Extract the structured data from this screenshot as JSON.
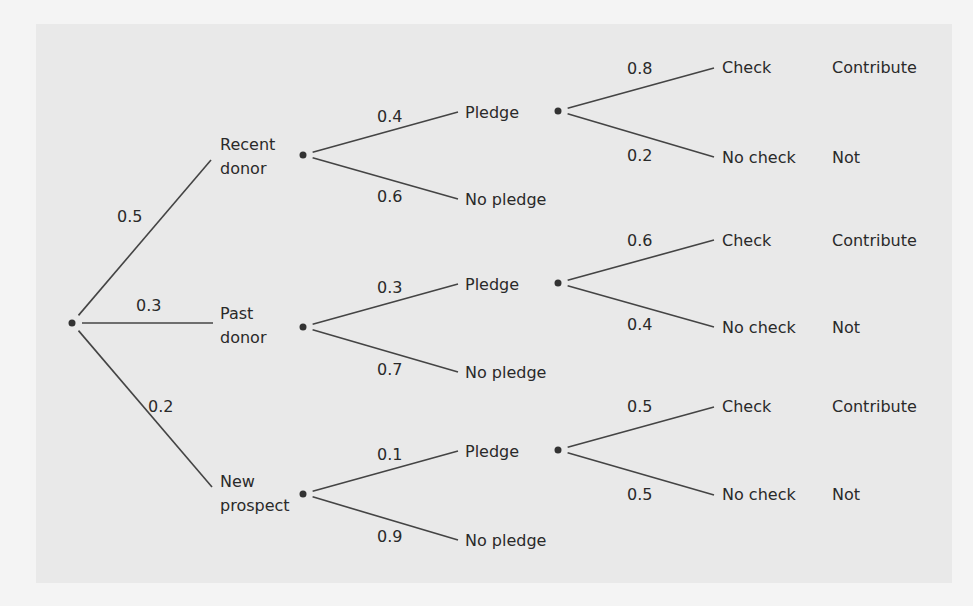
{
  "diagram": {
    "type": "probability tree",
    "root": {
      "x": 72,
      "y": 323
    },
    "level1": [
      {
        "label_lines": [
          "Recent",
          "donor"
        ],
        "prob": "0.5",
        "line_end": [
          211,
          160
        ],
        "prob_pos": [
          117,
          222
        ],
        "label_pos": [
          220,
          150
        ],
        "dot": [
          303,
          155
        ],
        "children": [
          {
            "label": "Pledge",
            "prob": "0.4",
            "line_end": [
              458,
              112
            ],
            "prob_pos": [
              377,
              122
            ],
            "label_pos": [
              465,
              118
            ]
          },
          {
            "label": "No pledge",
            "prob": "0.6",
            "line_end": [
              458,
              199
            ],
            "prob_pos": [
              377,
              202
            ],
            "label_pos": [
              465,
              205
            ]
          }
        ]
      },
      {
        "label_lines": [
          "Past",
          "donor"
        ],
        "prob": "0.3",
        "line_end": [
          213,
          323
        ],
        "prob_pos": [
          136,
          311
        ],
        "label_pos": [
          220,
          319
        ],
        "dot": [
          303,
          327
        ],
        "children": [
          {
            "label": "Pledge",
            "prob": "0.3",
            "line_end": [
              458,
              284
            ],
            "prob_pos": [
              377,
              293
            ],
            "label_pos": [
              465,
              290
            ]
          },
          {
            "label": "No pledge",
            "prob": "0.7",
            "line_end": [
              458,
              372
            ],
            "prob_pos": [
              377,
              375
            ],
            "label_pos": [
              465,
              378
            ]
          }
        ]
      },
      {
        "label_lines": [
          "New",
          "prospect"
        ],
        "prob": "0.2",
        "line_end": [
          212,
          487
        ],
        "prob_pos": [
          148,
          412
        ],
        "label_pos": [
          220,
          487
        ],
        "dot": [
          303,
          494
        ],
        "children": [
          {
            "label": "Pledge",
            "prob": "0.1",
            "line_end": [
              458,
              451
            ],
            "prob_pos": [
              377,
              460
            ],
            "label_pos": [
              465,
              457
            ]
          },
          {
            "label": "No pledge",
            "prob": "0.9",
            "line_end": [
              458,
              540
            ],
            "prob_pos": [
              377,
              542
            ],
            "label_pos": [
              465,
              546
            ]
          }
        ]
      }
    ],
    "level2": [
      {
        "dot": [
          558,
          111
        ],
        "outcomes": [
          {
            "label": "Check",
            "prob": "0.8",
            "result": "Contribute",
            "line_end": [
              714,
              68
            ],
            "prob_pos": [
              627,
              74
            ],
            "label_pos": [
              722,
              73
            ]
          },
          {
            "label": "No check",
            "prob": "0.2",
            "result": "Not",
            "line_end": [
              714,
              157
            ],
            "prob_pos": [
              627,
              161
            ],
            "label_pos": [
              722,
              163
            ]
          }
        ]
      },
      {
        "dot": [
          558,
          283
        ],
        "outcomes": [
          {
            "label": "Check",
            "prob": "0.6",
            "result": "Contribute",
            "line_end": [
              714,
              240
            ],
            "prob_pos": [
              627,
              246
            ],
            "label_pos": [
              722,
              246
            ]
          },
          {
            "label": "No check",
            "prob": "0.4",
            "result": "Not",
            "line_end": [
              714,
              327
            ],
            "prob_pos": [
              627,
              330
            ],
            "label_pos": [
              722,
              333
            ]
          }
        ]
      },
      {
        "dot": [
          558,
          450
        ],
        "outcomes": [
          {
            "label": "Check",
            "prob": "0.5",
            "result": "Contribute",
            "line_end": [
              714,
              407
            ],
            "prob_pos": [
              627,
              412
            ],
            "label_pos": [
              722,
              412
            ]
          },
          {
            "label": "No check",
            "prob": "0.5",
            "result": "Not",
            "line_end": [
              714,
              495
            ],
            "prob_pos": [
              627,
              500
            ],
            "label_pos": [
              722,
              500
            ]
          }
        ]
      }
    ],
    "result_x": 832
  }
}
